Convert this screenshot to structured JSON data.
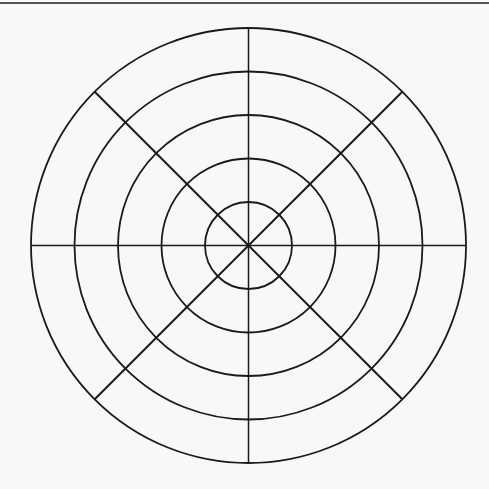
{
  "diagram": {
    "type": "polar-grid",
    "center": {
      "x": 248.5,
      "y": 245.5
    },
    "rings": [
      {
        "index": 1,
        "radius": 43.5
      },
      {
        "index": 2,
        "radius": 87
      },
      {
        "index": 3,
        "radius": 130.5
      },
      {
        "index": 4,
        "radius": 174
      },
      {
        "index": 5,
        "radius": 217.5
      }
    ],
    "spokes": [
      {
        "angle_deg": 0,
        "label": "horizontal"
      },
      {
        "angle_deg": 45,
        "label": "diagonal-ne-sw"
      },
      {
        "angle_deg": 90,
        "label": "vertical"
      },
      {
        "angle_deg": 135,
        "label": "diagonal-nw-se"
      }
    ],
    "stroke_color": "#1a1a1a",
    "background_color": "#f8f8f6",
    "rule_color": "#555555"
  }
}
